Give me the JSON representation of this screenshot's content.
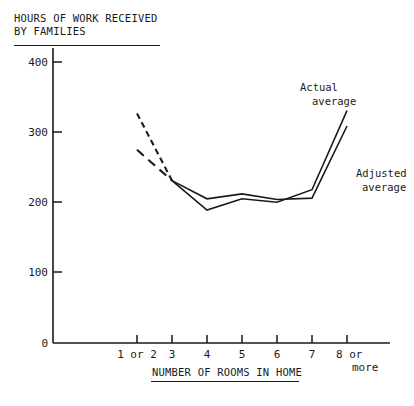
{
  "chart_data": {
    "type": "line",
    "title": "HOURS OF WORK RECEIVED BY FAMILIES",
    "title_line1": "HOURS OF WORK RECEIVED",
    "title_line2": "BY FAMILIES",
    "xlabel": "NUMBER OF ROOMS IN HOME",
    "ylabel": "HOURS OF WORK RECEIVED BY FAMILIES",
    "categories": [
      "1 or 2",
      "3",
      "4",
      "5",
      "6",
      "7",
      "8 or more"
    ],
    "x_tick_labels": [
      "1 or 2",
      "3",
      "4",
      "5",
      "6",
      "7",
      "8 or"
    ],
    "x_tick_label_last_line2": "more",
    "y_tick_labels": [
      "0",
      "100",
      "200",
      "300",
      "400"
    ],
    "y_ticks": [
      0,
      100,
      200,
      300,
      400
    ],
    "ylim": [
      0,
      420
    ],
    "grid": false,
    "legend_position": "inline-annotations",
    "series": [
      {
        "name": "Actual average",
        "annotation_line1": "Actual",
        "annotation_line2": "average",
        "values": [
          328,
          232,
          190,
          206,
          201,
          219,
          332
        ],
        "dashed_segments": [
          [
            0,
            1
          ]
        ],
        "color": "#1a1a1a"
      },
      {
        "name": "Adjusted average",
        "annotation_line1": "Adjusted",
        "annotation_line2": "average",
        "values": [
          276,
          232,
          206,
          213,
          205,
          207,
          310
        ],
        "dashed_segments": [
          [
            0,
            1
          ]
        ],
        "color": "#1a1a1a"
      }
    ],
    "annotations": [
      "Actual average",
      "Adjusted average"
    ],
    "axis_color": "#1a1a1a",
    "background_color": "#ffffff"
  }
}
